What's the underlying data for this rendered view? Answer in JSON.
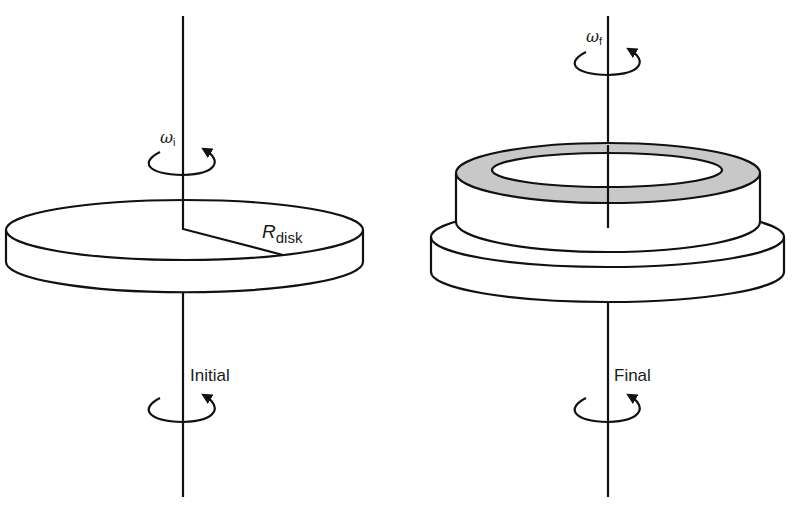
{
  "figure": {
    "colors": {
      "line": "#111111",
      "ring_fill": "#c8c8c8",
      "background": "#ffffff"
    },
    "initial": {
      "omega_symbol": "ω",
      "omega_subscript": "i",
      "radius_symbol": "R",
      "radius_subscript": "disk",
      "state_label": "Initial",
      "shape": "flat solid disk on vertical axis"
    },
    "final": {
      "omega_symbol": "ω",
      "omega_subscript": "f",
      "state_label": "Final",
      "shape": "disk with ring resting on top, ring top face shaded"
    },
    "icons": {
      "rotation_arrow": "counter-clockwise rotation arrow around axis"
    }
  }
}
